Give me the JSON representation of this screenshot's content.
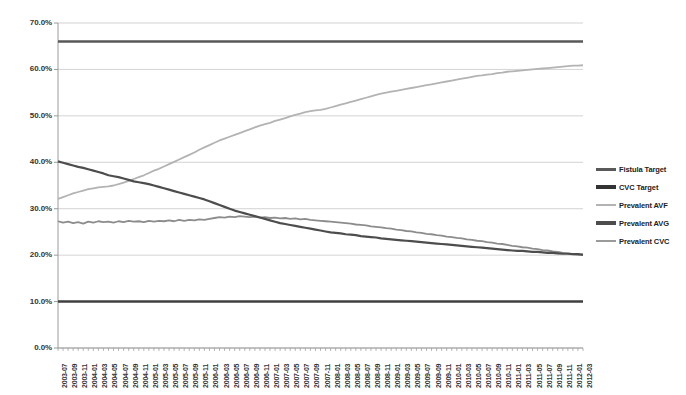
{
  "chart_data": {
    "type": "line",
    "title": "",
    "xlabel": "",
    "ylabel": "",
    "ylim": [
      0,
      70
    ],
    "ytick_labels": [
      "0.0%",
      "10.0%",
      "20.0%",
      "30.0%",
      "40.0%",
      "50.0%",
      "60.0%",
      "70.0%"
    ],
    "ytick_values": [
      0,
      10,
      20,
      30,
      40,
      50,
      60,
      70
    ],
    "grid": true,
    "legend_position": "right",
    "x": [
      "2003-07",
      "2003-08",
      "2003-09",
      "2003-10",
      "2003-11",
      "2003-12",
      "2004-01",
      "2004-02",
      "2004-03",
      "2004-04",
      "2004-05",
      "2004-06",
      "2004-07",
      "2004-08",
      "2004-09",
      "2004-10",
      "2004-11",
      "2004-12",
      "2005-01",
      "2005-02",
      "2005-03",
      "2005-04",
      "2005-05",
      "2005-06",
      "2005-07",
      "2005-08",
      "2005-09",
      "2005-10",
      "2005-11",
      "2005-12",
      "2006-01",
      "2006-02",
      "2006-03",
      "2006-04",
      "2006-05",
      "2006-06",
      "2006-07",
      "2006-08",
      "2006-09",
      "2006-10",
      "2006-11",
      "2006-12",
      "2007-01",
      "2007-02",
      "2007-03",
      "2007-04",
      "2007-05",
      "2007-06",
      "2007-07",
      "2007-08",
      "2007-09",
      "2007-10",
      "2007-11",
      "2007-12",
      "2008-01",
      "2008-02",
      "2008-03",
      "2008-04",
      "2008-05",
      "2008-06",
      "2008-07",
      "2008-08",
      "2008-09",
      "2008-10",
      "2008-11",
      "2008-12",
      "2009-01",
      "2009-02",
      "2009-03",
      "2009-04",
      "2009-05",
      "2009-06",
      "2009-07",
      "2009-08",
      "2009-09",
      "2009-10",
      "2009-11",
      "2009-12",
      "2010-01",
      "2010-02",
      "2010-03",
      "2010-04",
      "2010-05",
      "2010-06",
      "2010-07",
      "2010-08",
      "2010-09",
      "2010-10",
      "2010-11",
      "2010-12",
      "2011-01",
      "2011-02",
      "2011-03",
      "2011-04",
      "2011-05",
      "2011-06",
      "2011-07",
      "2011-08",
      "2011-09",
      "2011-10",
      "2011-11",
      "2011-12",
      "2012-01",
      "2012-02",
      "2012-03"
    ],
    "xtick_labels": [
      "2003-07",
      "2003-09",
      "2003-11",
      "2004-01",
      "2004-03",
      "2004-05",
      "2004-07",
      "2004-09",
      "2004-11",
      "2005-01",
      "2005-03",
      "2005-05",
      "2005-07",
      "2005-09",
      "2005-11",
      "2006-01",
      "2006-03",
      "2006-05",
      "2006-07",
      "2006-09",
      "2006-11",
      "2007-01",
      "2007-03",
      "2007-05",
      "2007-07",
      "2007-09",
      "2007-11",
      "2008-01",
      "2008-03",
      "2008-05",
      "2008-07",
      "2008-09",
      "2008-11",
      "2009-01",
      "2009-03",
      "2009-05",
      "2009-07",
      "2009-09",
      "2009-11",
      "2010-01",
      "2010-03",
      "2010-05",
      "2010-07",
      "2010-09",
      "2010-11",
      "2011-01",
      "2011-03",
      "2011-05",
      "2011-07",
      "2011-09",
      "2011-11",
      "2012-01",
      "2012-03"
    ],
    "series": [
      {
        "name": "Fistula Target",
        "color": "#595959",
        "width": 2.6,
        "values": [
          66,
          66,
          66,
          66,
          66,
          66,
          66,
          66,
          66,
          66,
          66,
          66,
          66,
          66,
          66,
          66,
          66,
          66,
          66,
          66,
          66,
          66,
          66,
          66,
          66,
          66,
          66,
          66,
          66,
          66,
          66,
          66,
          66,
          66,
          66,
          66,
          66,
          66,
          66,
          66,
          66,
          66,
          66,
          66,
          66,
          66,
          66,
          66,
          66,
          66,
          66,
          66,
          66,
          66,
          66,
          66,
          66,
          66,
          66,
          66,
          66,
          66,
          66,
          66,
          66,
          66,
          66,
          66,
          66,
          66,
          66,
          66,
          66,
          66,
          66,
          66,
          66,
          66,
          66,
          66,
          66,
          66,
          66,
          66,
          66,
          66,
          66,
          66,
          66,
          66,
          66,
          66,
          66,
          66,
          66,
          66,
          66,
          66,
          66,
          66,
          66,
          66,
          66,
          66,
          66
        ]
      },
      {
        "name": "CVC Target",
        "color": "#404040",
        "width": 2.6,
        "values": [
          10,
          10,
          10,
          10,
          10,
          10,
          10,
          10,
          10,
          10,
          10,
          10,
          10,
          10,
          10,
          10,
          10,
          10,
          10,
          10,
          10,
          10,
          10,
          10,
          10,
          10,
          10,
          10,
          10,
          10,
          10,
          10,
          10,
          10,
          10,
          10,
          10,
          10,
          10,
          10,
          10,
          10,
          10,
          10,
          10,
          10,
          10,
          10,
          10,
          10,
          10,
          10,
          10,
          10,
          10,
          10,
          10,
          10,
          10,
          10,
          10,
          10,
          10,
          10,
          10,
          10,
          10,
          10,
          10,
          10,
          10,
          10,
          10,
          10,
          10,
          10,
          10,
          10,
          10,
          10,
          10,
          10,
          10,
          10,
          10,
          10,
          10,
          10,
          10,
          10,
          10,
          10,
          10,
          10,
          10,
          10,
          10,
          10,
          10,
          10,
          10,
          10,
          10,
          10,
          10
        ]
      },
      {
        "name": "Prevalent AVF",
        "color": "#b3b3b3",
        "width": 1.8,
        "values": [
          32.1,
          32.5,
          32.9,
          33.3,
          33.6,
          33.9,
          34.2,
          34.4,
          34.6,
          34.7,
          34.8,
          35.0,
          35.3,
          35.6,
          36.0,
          36.4,
          36.8,
          37.2,
          37.7,
          38.2,
          38.6,
          39.1,
          39.6,
          40.1,
          40.6,
          41.1,
          41.6,
          42.1,
          42.7,
          43.2,
          43.7,
          44.2,
          44.7,
          45.1,
          45.5,
          45.9,
          46.3,
          46.7,
          47.1,
          47.5,
          47.9,
          48.2,
          48.5,
          48.9,
          49.2,
          49.5,
          49.9,
          50.2,
          50.5,
          50.8,
          51.0,
          51.2,
          51.3,
          51.5,
          51.8,
          52.1,
          52.4,
          52.7,
          53.0,
          53.3,
          53.6,
          53.9,
          54.2,
          54.5,
          54.8,
          55.0,
          55.2,
          55.4,
          55.6,
          55.8,
          56.0,
          56.2,
          56.4,
          56.6,
          56.8,
          57.0,
          57.2,
          57.4,
          57.6,
          57.8,
          58.0,
          58.2,
          58.4,
          58.6,
          58.7,
          58.9,
          59.0,
          59.2,
          59.3,
          59.5,
          59.6,
          59.7,
          59.8,
          59.9,
          60.0,
          60.1,
          60.2,
          60.3,
          60.4,
          60.5,
          60.6,
          60.7,
          60.8,
          60.8,
          60.9
        ]
      },
      {
        "name": "Prevalent AVG",
        "color": "#8c8c8c",
        "width": 1.8,
        "values": [
          27.3,
          27.0,
          27.2,
          26.9,
          27.1,
          26.8,
          27.2,
          27.0,
          27.3,
          27.1,
          27.2,
          27.0,
          27.3,
          27.1,
          27.4,
          27.2,
          27.3,
          27.1,
          27.4,
          27.2,
          27.4,
          27.3,
          27.5,
          27.3,
          27.6,
          27.4,
          27.6,
          27.5,
          27.7,
          27.6,
          27.8,
          28.0,
          28.2,
          28.1,
          28.3,
          28.2,
          28.4,
          28.3,
          28.2,
          28.3,
          28.1,
          28.2,
          28.0,
          28.1,
          27.9,
          28.0,
          27.8,
          27.9,
          27.7,
          27.8,
          27.6,
          27.5,
          27.4,
          27.3,
          27.2,
          27.1,
          27.0,
          26.9,
          26.8,
          26.6,
          26.5,
          26.4,
          26.2,
          26.1,
          26.0,
          25.8,
          25.7,
          25.5,
          25.4,
          25.2,
          25.1,
          24.9,
          24.8,
          24.6,
          24.5,
          24.3,
          24.2,
          24.0,
          23.9,
          23.7,
          23.6,
          23.4,
          23.3,
          23.1,
          23.0,
          22.8,
          22.7,
          22.5,
          22.4,
          22.2,
          22.0,
          21.9,
          21.7,
          21.6,
          21.4,
          21.3,
          21.1,
          21.0,
          20.8,
          20.7,
          20.5,
          20.4,
          20.2,
          20.1,
          20.0
        ]
      },
      {
        "name": "Prevalent CVC",
        "color": "#4d4d4d",
        "width": 2.2,
        "values": [
          40.2,
          39.9,
          39.6,
          39.3,
          39.0,
          38.8,
          38.5,
          38.2,
          37.9,
          37.6,
          37.2,
          37.0,
          36.8,
          36.5,
          36.2,
          35.9,
          35.7,
          35.5,
          35.3,
          35.0,
          34.7,
          34.4,
          34.1,
          33.8,
          33.5,
          33.2,
          32.9,
          32.6,
          32.3,
          32.0,
          31.6,
          31.2,
          30.8,
          30.4,
          30.0,
          29.6,
          29.3,
          29.0,
          28.7,
          28.4,
          28.1,
          27.8,
          27.5,
          27.2,
          26.9,
          26.7,
          26.5,
          26.3,
          26.1,
          25.9,
          25.7,
          25.5,
          25.3,
          25.1,
          24.9,
          24.8,
          24.7,
          24.5,
          24.4,
          24.3,
          24.1,
          24.0,
          23.9,
          23.8,
          23.6,
          23.5,
          23.4,
          23.3,
          23.2,
          23.1,
          23.0,
          22.9,
          22.8,
          22.7,
          22.6,
          22.5,
          22.4,
          22.3,
          22.2,
          22.1,
          22.0,
          21.9,
          21.8,
          21.7,
          21.6,
          21.5,
          21.4,
          21.3,
          21.2,
          21.1,
          21.0,
          20.9,
          20.9,
          20.8,
          20.7,
          20.7,
          20.6,
          20.5,
          20.5,
          20.4,
          20.3,
          20.3,
          20.2,
          20.2,
          20.1
        ]
      }
    ]
  },
  "legend": {
    "items": [
      {
        "label": "Fistula Target",
        "color": "#595959",
        "height": 3
      },
      {
        "label": "CVC Target",
        "color": "#333333",
        "height": 3.4
      },
      {
        "label": "Prevalent AVF",
        "color": "#b3b3b3",
        "height": 2.4
      },
      {
        "label": "Prevalent AVG",
        "color": "#4d4d4d",
        "height": 3.2
      },
      {
        "label": "Prevalent CVC",
        "color": "#9a9a9a",
        "height": 2.6
      }
    ]
  }
}
